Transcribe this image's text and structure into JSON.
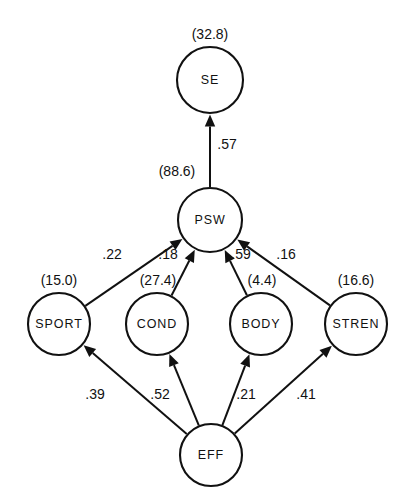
{
  "figure": {
    "type": "path-diagram",
    "title": "",
    "caption": ""
  },
  "nodes": [
    {
      "id": "SE",
      "label": "SE",
      "variance_label": "(32.8)",
      "cx": 210,
      "cy": 80,
      "r": 33
    },
    {
      "id": "PSW",
      "label": "PSW",
      "variance_label": "(88.6)",
      "cx": 210,
      "cy": 220,
      "r": 32
    },
    {
      "id": "SPORT",
      "label": "SPORT",
      "variance_label": "(15.0)",
      "cx": 59,
      "cy": 324,
      "r": 31
    },
    {
      "id": "COND",
      "label": "COND",
      "variance_label": "(27.4)",
      "cx": 157,
      "cy": 324,
      "r": 31
    },
    {
      "id": "BODY",
      "label": "BODY",
      "variance_label": "(4.4)",
      "cx": 261,
      "cy": 324,
      "r": 31
    },
    {
      "id": "STREN",
      "label": "STREN",
      "variance_label": "(16.6)",
      "cx": 356,
      "cy": 324,
      "r": 31
    },
    {
      "id": "EFF",
      "label": "EFF",
      "variance_label": "",
      "cx": 211,
      "cy": 455,
      "r": 31
    }
  ],
  "variance_labels": [
    {
      "node": "SE",
      "text": "(32.8)",
      "x": 210,
      "y": 35
    },
    {
      "node": "PSW",
      "text": "(88.6)",
      "x": 177,
      "y": 172
    },
    {
      "node": "SPORT",
      "text": "(15.0)",
      "x": 59,
      "y": 281
    },
    {
      "node": "COND",
      "text": "(27.4)",
      "x": 158,
      "y": 281
    },
    {
      "node": "BODY",
      "text": "(4.4)",
      "x": 262,
      "y": 281
    },
    {
      "node": "STREN",
      "text": "(16.6)",
      "x": 356,
      "y": 281
    }
  ],
  "edges": [
    {
      "from": "PSW",
      "to": "SE",
      "coefficient": ".57",
      "label_x": 227,
      "label_y": 145
    },
    {
      "from": "SPORT",
      "to": "PSW",
      "coefficient": ".22",
      "label_x": 112,
      "label_y": 255
    },
    {
      "from": "COND",
      "to": "PSW",
      "coefficient": ".18",
      "label_x": 168,
      "label_y": 255
    },
    {
      "from": "BODY",
      "to": "PSW",
      "coefficient": ".59",
      "label_x": 241,
      "label_y": 255
    },
    {
      "from": "STREN",
      "to": "PSW",
      "coefficient": ".16",
      "label_x": 286,
      "label_y": 255
    },
    {
      "from": "EFF",
      "to": "SPORT",
      "coefficient": ".39",
      "label_x": 95,
      "label_y": 395
    },
    {
      "from": "EFF",
      "to": "COND",
      "coefficient": ".52",
      "label_x": 160,
      "label_y": 395
    },
    {
      "from": "EFF",
      "to": "BODY",
      "coefficient": ".21",
      "label_x": 246,
      "label_y": 395
    },
    {
      "from": "EFF",
      "to": "STREN",
      "coefficient": ".41",
      "label_x": 306,
      "label_y": 395
    }
  ],
  "colors": {
    "stroke": "#111111",
    "fill": "#ffffff",
    "text": "#111111"
  }
}
